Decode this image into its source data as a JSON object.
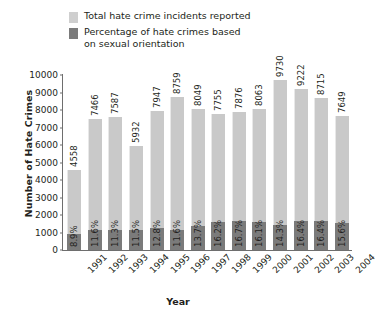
{
  "chart_data": {
    "type": "bar",
    "title": "",
    "xlabel": "Year",
    "ylabel": "Number of Hate Crimes",
    "ylim": [
      0,
      10000
    ],
    "yticks": [
      0,
      1000,
      2000,
      3000,
      4000,
      5000,
      6000,
      7000,
      8000,
      9000,
      10000
    ],
    "grid": false,
    "legend_position": "top",
    "categories": [
      "1991",
      "1992",
      "1993",
      "1994",
      "1995",
      "1996",
      "1997",
      "1998",
      "1999",
      "2000",
      "2001",
      "2002",
      "2003",
      "2004"
    ],
    "series": [
      {
        "name": "Total hate crime incidents reported",
        "color": "#c9c9c9",
        "values": [
          4558,
          7466,
          7587,
          5932,
          7947,
          8759,
          8049,
          7755,
          7876,
          8063,
          9730,
          9222,
          8715,
          7649
        ],
        "labels": [
          "4558",
          "7466",
          "7587",
          "5932",
          "7947",
          "8759",
          "8049",
          "7755",
          "7876",
          "8063",
          "9730",
          "9222",
          "8715",
          "7649"
        ]
      },
      {
        "name": "Percentage of hate crimes based on sexual orientation",
        "color": "#7b7b7b",
        "values": [
          8.9,
          11.6,
          11.3,
          11.5,
          12.8,
          11.6,
          13.7,
          16.2,
          16.7,
          16.1,
          14.3,
          16.4,
          16.4,
          15.6
        ],
        "labels": [
          "8.9%",
          "11.6%",
          "11.3%",
          "11.5%",
          "12.8%",
          "11.6%",
          "13.7%",
          "16.2%",
          "16.7%",
          "16.1%",
          "14.3%",
          "16.4%",
          "16.4%",
          "15.6%"
        ]
      }
    ]
  },
  "legend": {
    "items": [
      {
        "label": "Total hate crime incidents reported",
        "swatch": "light"
      },
      {
        "label": "Percentage of hate crimes based\non sexual orientation",
        "swatch": "dark"
      }
    ]
  }
}
